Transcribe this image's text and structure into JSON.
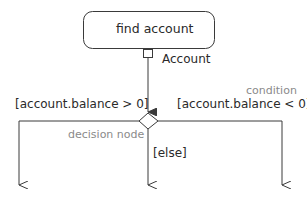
{
  "diagram": {
    "type": "UML activity diagram",
    "action": {
      "label": "find account"
    },
    "output_pin": {
      "label": "Account"
    },
    "annotations": {
      "condition": "condition",
      "decision_node": "decision node"
    },
    "guards": {
      "left": "[account.balance > 0]",
      "right": "[account.balance < 0]",
      "center": "[else]"
    },
    "colors": {
      "line": "#3a3a3a",
      "text": "#2a2a2a",
      "annotation": "#8a8a8a"
    }
  }
}
